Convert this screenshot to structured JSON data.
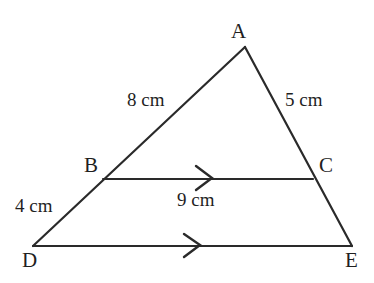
{
  "figure": {
    "kind": "geometry-diagram",
    "background_color": "#ffffff",
    "stroke_color": "#2a2a2a",
    "text_color": "#1f1f1f",
    "stroke_width": 2,
    "vertices": [
      {
        "id": "A",
        "label": "A",
        "x": 245,
        "y": 47
      },
      {
        "id": "B",
        "label": "B",
        "x": 103,
        "y": 179
      },
      {
        "id": "C",
        "label": "C",
        "x": 313,
        "y": 179
      },
      {
        "id": "D",
        "label": "D",
        "x": 33,
        "y": 246
      },
      {
        "id": "E",
        "label": "E",
        "x": 352,
        "y": 246
      }
    ],
    "segments": [
      {
        "id": "AD",
        "from": "A",
        "to": "D",
        "length_label": "8 cm"
      },
      {
        "id": "AE",
        "from": "A",
        "to": "E",
        "length_label": "5 cm"
      },
      {
        "id": "BD",
        "from": "B",
        "to": "D",
        "length_label": "4 cm"
      },
      {
        "id": "BC",
        "from": "B",
        "to": "C",
        "length_label": "9 cm",
        "arrow_marks": 1
      },
      {
        "id": "DE",
        "from": "D",
        "to": "E",
        "length_label": "",
        "arrow_marks": 1
      }
    ],
    "measure_labels": {
      "side_ad": "8 cm",
      "side_ae": "5 cm",
      "side_bd": "4 cm",
      "side_bc": "9 cm"
    },
    "vertex_labels": {
      "a": "A",
      "b": "B",
      "c": "C",
      "d": "D",
      "e": "E"
    },
    "parallel_marks": [
      {
        "on_segment": "BC",
        "x": 210,
        "y": 179,
        "style": "single-chevron"
      },
      {
        "on_segment": "DE",
        "x": 198,
        "y": 246,
        "style": "single-chevron"
      }
    ]
  }
}
